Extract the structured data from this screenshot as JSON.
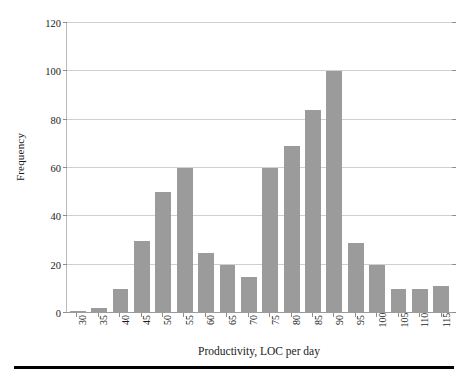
{
  "chart_data": {
    "type": "bar",
    "title": "",
    "subtitle": "",
    "xlabel": "Productivity, LOC per day",
    "ylabel": "Frequency",
    "categories": [
      "30",
      "35",
      "40",
      "45",
      "50",
      "55",
      "60",
      "65",
      "70",
      "75",
      "80",
      "85",
      "90",
      "95",
      "100",
      "105",
      "110",
      "115"
    ],
    "values": [
      1,
      2,
      10,
      30,
      50,
      60,
      25,
      20,
      15,
      60,
      69,
      84,
      100,
      29,
      20,
      10,
      10,
      11
    ],
    "series": [
      {
        "name": "Frequency",
        "values": [
          1,
          2,
          10,
          30,
          50,
          60,
          25,
          20,
          15,
          60,
          69,
          84,
          100,
          29,
          20,
          10,
          10,
          11
        ]
      }
    ],
    "ylim": [
      0,
      120
    ],
    "yticks": [
      0,
      20,
      40,
      60,
      80,
      100,
      120
    ],
    "ytick_labels": [
      "0",
      "20",
      "40",
      "60",
      "80",
      "100",
      "120"
    ],
    "xtick_labels_rotation": -90,
    "grid": true,
    "grid_axis": "y",
    "legend": false,
    "legend_position": "none",
    "bar_color": "#9b9b9b",
    "grid_color": "#cfcfcf",
    "axis_color": "#8e8e8e",
    "background_color": "#ffffff",
    "annotations": []
  },
  "figure": {
    "bottom_rule_color": "#000000"
  }
}
